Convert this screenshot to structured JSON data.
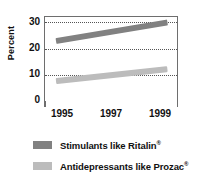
{
  "chart_data": {
    "type": "line",
    "title": "",
    "xlabel": "",
    "ylabel": "Percent",
    "x": [
      1995,
      1996,
      1997,
      1998,
      1999
    ],
    "xtick_labels": [
      "1995",
      "1997",
      "1999"
    ],
    "xtick_values": [
      1995,
      1997,
      1999
    ],
    "ytick_labels": [
      "0",
      "10",
      "20",
      "30"
    ],
    "ytick_values": [
      0,
      10,
      20,
      30
    ],
    "ylim": [
      0,
      32
    ],
    "xlim": [
      1994.6,
      1999.4
    ],
    "grid": "horizontal-dotted",
    "legend_position": "below",
    "series": [
      {
        "name": "Stimulants like Ritalin®",
        "label_text": "Stimulants like Ritalin",
        "label_sup": "®",
        "color": "#818181",
        "start_value": 23,
        "end_value": 30,
        "values": [
          23,
          24.7,
          26.4,
          28.2,
          30
        ]
      },
      {
        "name": "Antidepressants like Prozac®",
        "label_text": "Antidepressants like Prozac",
        "label_sup": "®",
        "color": "#bcbcbc",
        "start_value": 8,
        "end_value": 12.5,
        "values": [
          8,
          9.1,
          10.2,
          11.3,
          12.5
        ]
      }
    ]
  },
  "axis": {
    "y_title": "Percent",
    "y_labels": [
      "30",
      "20",
      "10",
      "0"
    ],
    "x_labels": [
      "1995",
      "1997",
      "1999"
    ]
  },
  "legend": {
    "items": [
      {
        "text": "Stimulants like Ritalin",
        "sup": "®",
        "color": "#818181"
      },
      {
        "text": "Antidepressants like Prozac",
        "sup": "®",
        "color": "#bcbcbc"
      }
    ]
  },
  "colors": {
    "stimulants": "#818181",
    "antidepressants": "#bcbcbc",
    "frame": "#6e6e6e",
    "grid": "#555555",
    "text": "#111111",
    "background": "#ffffff"
  }
}
